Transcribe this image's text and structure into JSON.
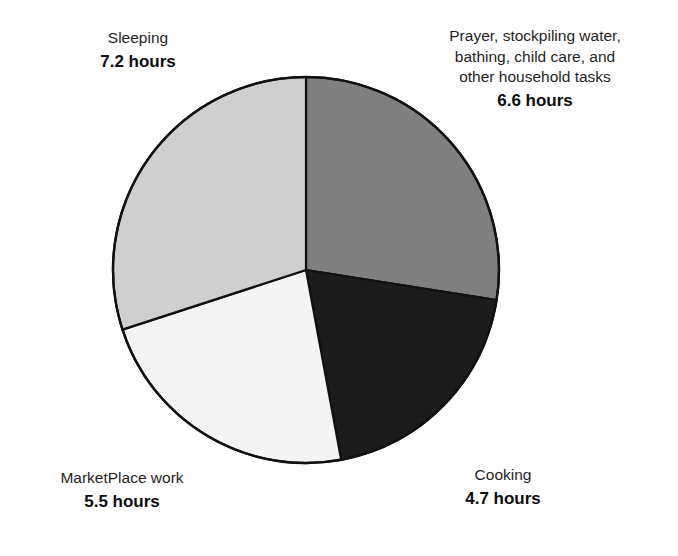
{
  "chart_data": {
    "type": "pie",
    "title": "",
    "unit": "hours",
    "total": 24.0,
    "legend_position": "outside-labels",
    "grid": false,
    "categories": [
      "Prayer, stockpiling water, bathing, child care, and other household tasks",
      "Cooking",
      "MarketPlace work",
      "Sleeping"
    ],
    "values": [
      6.6,
      4.7,
      5.5,
      7.2
    ],
    "colors": [
      "#7f7f7f",
      "#1c1c1c",
      "#f4f4f4",
      "#cfcfcf"
    ],
    "start_angle_deg": 0,
    "direction": "clockwise",
    "slice_angles_deg": [
      99.0,
      70.5,
      82.5,
      108.0
    ],
    "slices": [
      {
        "name": "Prayer, stockpiling water, bathing, child care, and other household tasks",
        "value": 6.6,
        "value_label": "6.6 hours",
        "color": "#7f7f7f",
        "angle_deg": 99.0
      },
      {
        "name": "Cooking",
        "value": 4.7,
        "value_label": "4.7 hours",
        "color": "#1c1c1c",
        "angle_deg": 70.5
      },
      {
        "name": "MarketPlace work",
        "value": 5.5,
        "value_label": "5.5 hours",
        "color": "#f4f4f4",
        "angle_deg": 82.5
      },
      {
        "name": "Sleeping",
        "value": 7.2,
        "value_label": "7.2 hours",
        "color": "#cfcfcf",
        "angle_deg": 108.0
      }
    ]
  },
  "labels": {
    "sleeping": {
      "name": "Sleeping",
      "value": "7.2 hours"
    },
    "prayer": {
      "line1": "Prayer, stockpiling water,",
      "line2": "bathing, child care, and",
      "line3": "other household tasks",
      "value": "6.6 hours"
    },
    "marketplace": {
      "name": "MarketPlace work",
      "value": "5.5 hours"
    },
    "cooking": {
      "name": "Cooking",
      "value": "4.7 hours"
    }
  },
  "style": {
    "outline_color": "#111111",
    "background": "#ffffff"
  }
}
